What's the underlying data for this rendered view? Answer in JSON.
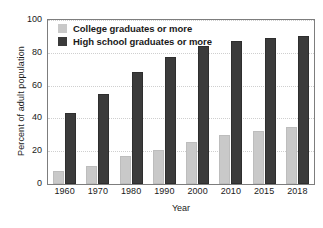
{
  "chart_data": {
    "type": "bar",
    "title": "",
    "xlabel": "Year",
    "ylabel": "Percent of adult population",
    "categories": [
      "1960",
      "1970",
      "1980",
      "1990",
      "2000",
      "2010",
      "2015",
      "2018"
    ],
    "series": [
      {
        "name": "College graduates or more",
        "color": "#c9c9c9",
        "values": [
          8,
          11,
          17,
          21,
          25.5,
          30,
          32.5,
          35
        ]
      },
      {
        "name": "High school graduates or more",
        "color": "#3b3b3b",
        "values": [
          43,
          55,
          68,
          77.5,
          84,
          87,
          89,
          90
        ]
      }
    ],
    "ylim": [
      0,
      100
    ],
    "yticks": [
      0,
      20,
      40,
      60,
      80,
      100
    ],
    "ytick_labels": [
      "0",
      "20",
      "40",
      "60",
      "80",
      "100"
    ],
    "grid": "horizontal-dotted",
    "legend_position": "top-left-inside"
  },
  "colors": {
    "college": "#c9c9c9",
    "highschool": "#3b3b3b",
    "gridline": "#cfcfcf",
    "axis": "#7d7d7d",
    "text": "#1a1a1a",
    "background": "#ffffff"
  }
}
